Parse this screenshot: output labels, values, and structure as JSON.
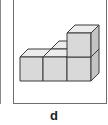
{
  "panel": {
    "label": "d",
    "description": "Isometric arrangement of 4 cubes: 3 in a row on the bottom, 1 stacked on the right end, with a cube behind the middle"
  },
  "cubes": {
    "count_visible": 5,
    "colors": {
      "front": "#d9d9d9",
      "top": "#ececec",
      "side": "#c4c4c4",
      "edge": "#3a3a3a"
    }
  }
}
